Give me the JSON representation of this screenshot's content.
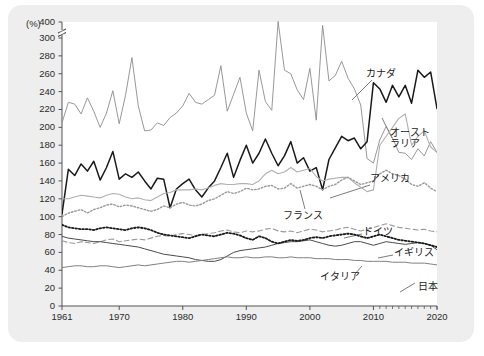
{
  "figure": {
    "unit_label": "(%)",
    "background_color": "#eeeeee",
    "plot_background": "#ffffff",
    "footnote": ""
  },
  "chart_data": {
    "type": "line",
    "title": "",
    "xlabel": "",
    "ylabel": "(%)",
    "xlim": [
      1961,
      2020
    ],
    "ylim": [
      0,
      300
    ],
    "y_axis_break": {
      "between": [
        300,
        400
      ],
      "top_value": 400
    },
    "grid": false,
    "legend_position": "inline-annotations",
    "ytick_labels": [
      400,
      300,
      280,
      260,
      240,
      220,
      200,
      180,
      160,
      140,
      120,
      100,
      80,
      60,
      40,
      20,
      0
    ],
    "xtick_labels": [
      1961,
      1970,
      1980,
      1990,
      2000,
      2010,
      2020
    ],
    "x_minor_ticks_years": [
      2011,
      2012,
      2013,
      2014,
      2015,
      2016,
      2017,
      2018,
      2019,
      2020
    ],
    "x": [
      1961,
      1962,
      1963,
      1964,
      1965,
      1966,
      1967,
      1968,
      1969,
      1970,
      1971,
      1972,
      1973,
      1974,
      1975,
      1976,
      1977,
      1978,
      1979,
      1980,
      1981,
      1982,
      1983,
      1984,
      1985,
      1986,
      1987,
      1988,
      1989,
      1990,
      1991,
      1992,
      1993,
      1994,
      1995,
      1996,
      1997,
      1998,
      1999,
      2000,
      2001,
      2002,
      2003,
      2004,
      2005,
      2006,
      2007,
      2008,
      2009,
      2010,
      2011,
      2012,
      2013,
      2014,
      2015,
      2016,
      2017,
      2018,
      2019,
      2020
    ],
    "series": [
      {
        "name": "オーストラリア",
        "label": "オースト\nラリア",
        "name_romaji": "Australia",
        "style": "solid",
        "color": "#8c8c8c",
        "width": 0.9,
        "values": [
          205,
          228,
          226,
          215,
          233,
          218,
          200,
          216,
          241,
          204,
          236,
          278,
          224,
          196,
          197,
          205,
          202,
          211,
          216,
          224,
          238,
          228,
          226,
          231,
          236,
          269,
          218,
          237,
          256,
          216,
          196,
          264,
          229,
          219,
          403,
          264,
          260,
          242,
          231,
          266,
          208,
          379,
          252,
          258,
          274,
          255,
          243,
          225,
          165,
          160,
          186,
          201,
          188,
          172,
          171,
          164,
          176,
          168,
          184,
          172
        ]
      },
      {
        "name": "カナダ",
        "label": "カナダ",
        "name_romaji": "Canada",
        "style": "solid",
        "color": "#1a1a1a",
        "width": 1.5,
        "values": [
          103,
          153,
          146,
          159,
          151,
          162,
          141,
          155,
          173,
          142,
          148,
          144,
          150,
          140,
          131,
          143,
          142,
          110,
          131,
          137,
          142,
          130,
          122,
          132,
          140,
          155,
          171,
          144,
          163,
          180,
          160,
          171,
          187,
          171,
          157,
          168,
          184,
          160,
          166,
          151,
          155,
          130,
          164,
          177,
          190,
          185,
          188,
          176,
          184,
          250,
          243,
          228,
          247,
          234,
          247,
          227,
          264,
          256,
          262,
          221
        ]
      },
      {
        "name": "アメリカ",
        "label": "アメリカ",
        "name_romaji": "United States",
        "style": "solid",
        "color": "#b0b0b0",
        "width": 1.1,
        "values": [
          120,
          120,
          122,
          124,
          123,
          122,
          121,
          124,
          126,
          125,
          122,
          120,
          121,
          119,
          118,
          122,
          126,
          127,
          130,
          130,
          130,
          131,
          130,
          132,
          135,
          137,
          136,
          136,
          137,
          137,
          136,
          140,
          148,
          152,
          148,
          150,
          155,
          150,
          152,
          154,
          145,
          140,
          142,
          143,
          144,
          144,
          138,
          133,
          128,
          130,
          180,
          190,
          200,
          210,
          215,
          180,
          190,
          196,
          178,
          172
        ]
      },
      {
        "name": "フランス",
        "label": "フランス",
        "name_romaji": "France",
        "style": "dotted",
        "color": "#9a9a9a",
        "width": 1.4,
        "values": [
          100,
          104,
          106,
          108,
          104,
          108,
          110,
          113,
          114,
          111,
          113,
          112,
          110,
          108,
          106,
          108,
          112,
          110,
          114,
          116,
          113,
          112,
          114,
          118,
          120,
          124,
          128,
          126,
          128,
          132,
          130,
          131,
          134,
          135,
          131,
          132,
          137,
          132,
          134,
          136,
          134,
          130,
          134,
          136,
          141,
          144,
          140,
          136,
          138,
          140,
          148,
          152,
          148,
          146,
          142,
          136,
          134,
          138,
          132,
          128
        ]
      },
      {
        "name": "ドイツ",
        "label": "ドイツ",
        "name_romaji": "Germany",
        "style": "dashed",
        "color": "#9a9a9a",
        "width": 1.1,
        "values": [
          73,
          71,
          70,
          72,
          71,
          70,
          72,
          74,
          75,
          72,
          73,
          74,
          75,
          74,
          76,
          78,
          79,
          78,
          80,
          81,
          80,
          79,
          80,
          81,
          82,
          84,
          85,
          83,
          82,
          84,
          83,
          84,
          86,
          87,
          84,
          83,
          84,
          82,
          84,
          86,
          85,
          83,
          84,
          85,
          87,
          88,
          86,
          84,
          86,
          88,
          90,
          92,
          90,
          88,
          87,
          86,
          85,
          86,
          84,
          83
        ]
      },
      {
        "name": "イギリス",
        "label": "イギリス",
        "name_romaji": "United Kingdom",
        "style": "solid",
        "color": "#4a4a4a",
        "width": 1.0,
        "values": [
          78,
          76,
          75,
          74,
          73,
          72,
          72,
          71,
          70,
          69,
          68,
          67,
          66,
          64,
          62,
          60,
          58,
          57,
          56,
          55,
          54,
          52,
          51,
          50,
          50,
          52,
          56,
          60,
          62,
          63,
          64,
          65,
          66,
          68,
          70,
          71,
          72,
          72,
          73,
          74,
          72,
          70,
          68,
          67,
          68,
          70,
          72,
          72,
          70,
          68,
          70,
          72,
          71,
          70,
          69,
          70,
          71,
          70,
          68,
          63
        ]
      },
      {
        "name": "イタリア",
        "label": "イタリア",
        "name_romaji": "Italy",
        "style": "dotted",
        "color": "#1a1a1a",
        "width": 1.8,
        "values": [
          91,
          88,
          87,
          86,
          86,
          85,
          87,
          88,
          87,
          86,
          85,
          87,
          88,
          87,
          85,
          82,
          80,
          79,
          78,
          77,
          76,
          78,
          80,
          79,
          78,
          80,
          82,
          81,
          79,
          76,
          74,
          78,
          76,
          72,
          70,
          72,
          74,
          73,
          74,
          76,
          77,
          76,
          78,
          79,
          80,
          81,
          80,
          78,
          76,
          78,
          80,
          78,
          76,
          74,
          73,
          72,
          71,
          70,
          68,
          66
        ]
      },
      {
        "name": "日本",
        "label": "日本",
        "name_romaji": "Japan",
        "style": "solid",
        "color": "#808080",
        "width": 1.0,
        "values": [
          43,
          44,
          45,
          45,
          44,
          44,
          45,
          45,
          44,
          43,
          44,
          45,
          46,
          45,
          46,
          47,
          48,
          49,
          50,
          50,
          49,
          50,
          51,
          52,
          53,
          54,
          55,
          54,
          54,
          55,
          54,
          54,
          55,
          55,
          54,
          54,
          55,
          54,
          54,
          54,
          53,
          53,
          53,
          52,
          52,
          52,
          51,
          51,
          50,
          50,
          50,
          50,
          49,
          49,
          49,
          48,
          48,
          48,
          47,
          46
        ]
      }
    ],
    "annotations": [
      {
        "text": "カナダ",
        "series": "カナダ"
      },
      {
        "text": "オースト\nラリア",
        "series": "オーストラリア"
      },
      {
        "text": "アメリカ",
        "series": "アメリカ"
      },
      {
        "text": "フランス",
        "series": "フランス"
      },
      {
        "text": "ドイツ",
        "series": "ドイツ"
      },
      {
        "text": "イギリス",
        "series": "イギリス"
      },
      {
        "text": "イタリア",
        "series": "イタリア"
      },
      {
        "text": "日本",
        "series": "日本"
      }
    ]
  },
  "labels": {
    "canada": "カナダ",
    "australia_line1": "オースト",
    "australia_line2": "ラリア",
    "usa": "アメリカ",
    "france": "フランス",
    "germany": "ドイツ",
    "uk": "イギリス",
    "italy": "イタリア",
    "japan": "日本"
  },
  "yticks": [
    "400",
    "300",
    "280",
    "260",
    "240",
    "220",
    "200",
    "180",
    "160",
    "140",
    "120",
    "100",
    "80",
    "60",
    "40",
    "20",
    "0"
  ],
  "xticks": [
    "1961",
    "1970",
    "1980",
    "1990",
    "2000",
    "2010",
    "2020"
  ]
}
